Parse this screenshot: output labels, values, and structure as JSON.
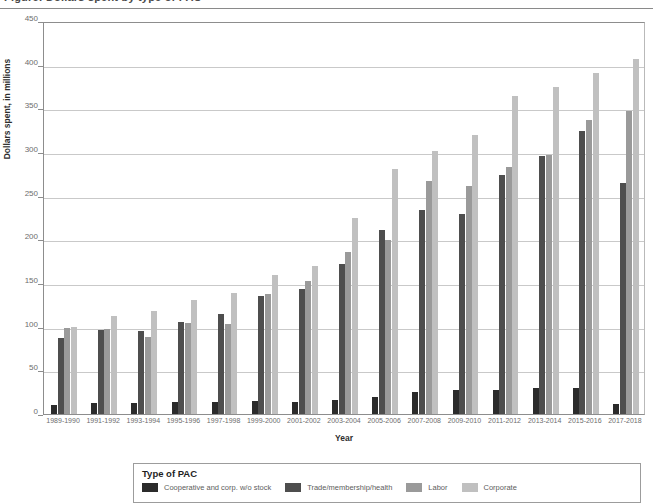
{
  "header": {
    "clipped_text": "Figure: Dollars spent by type of PAC"
  },
  "chart_data": {
    "type": "bar",
    "title": "",
    "xlabel": "Year",
    "ylabel": "Dollars spent, in millions",
    "ylim": [
      0,
      450
    ],
    "ytick_values": [
      0,
      50,
      100,
      150,
      200,
      250,
      300,
      350,
      400,
      450
    ],
    "ytick_labels": [
      "0",
      "50",
      "100",
      "150",
      "200",
      "250",
      "300",
      "350",
      "400",
      "450"
    ],
    "grid": true,
    "legend_position": "bottom",
    "legend_title": "Type of PAC",
    "categories": [
      "1989-1990",
      "1991-1992",
      "1993-1994",
      "1995-1996",
      "1997-1998",
      "1999-2000",
      "2001-2002",
      "2003-2004",
      "2005-2006",
      "2007-2008",
      "2009-2010",
      "2011-2012",
      "2013-2014",
      "2015-2016",
      "2017-2018"
    ],
    "series": [
      {
        "name": "Cooperative and corp. w/o stock",
        "color": "#2b2b2b",
        "values": [
          10,
          13,
          13,
          14,
          14,
          15,
          14,
          16,
          19,
          25,
          28,
          27,
          30,
          30,
          12
        ]
      },
      {
        "name": "Trade/membership/health",
        "color": "#4e4e4e",
        "values": [
          87,
          96,
          95,
          105,
          115,
          135,
          143,
          172,
          211,
          234,
          229,
          274,
          295,
          324,
          265
        ]
      },
      {
        "name": "Labor",
        "color": "#9a9a9a",
        "values": [
          99,
          97,
          88,
          104,
          103,
          137,
          152,
          186,
          199,
          267,
          261,
          283,
          297,
          337,
          347
        ]
      },
      {
        "name": "Corporate",
        "color": "#c0c0c0",
        "values": [
          100,
          112,
          118,
          131,
          138,
          159,
          170,
          224,
          280,
          301,
          320,
          364,
          375,
          390,
          406
        ]
      }
    ]
  }
}
